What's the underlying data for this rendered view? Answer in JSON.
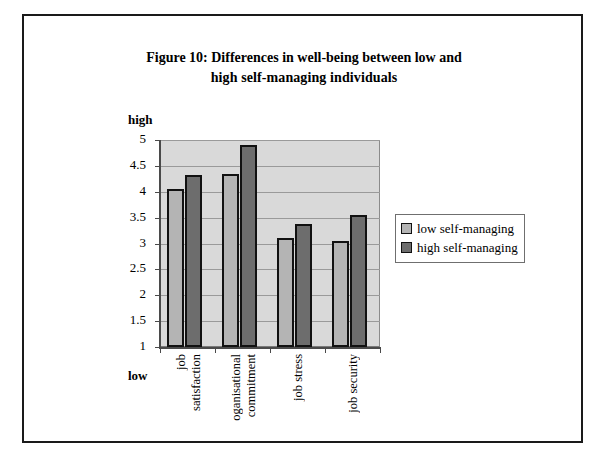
{
  "chart_data": {
    "type": "bar",
    "title_lines": [
      "Figure 10: Differences in well-being between low and",
      "high self-managing individuals"
    ],
    "title": "Figure 10: Differences in well-being between low and high self-managing individuals",
    "categories": [
      "job satisfaction",
      "oganisational commitment",
      "job stress",
      "job security"
    ],
    "category_words": [
      [
        "job",
        "satisfaction"
      ],
      [
        "oganisational",
        "commitment"
      ],
      [
        "job stress"
      ],
      [
        "job security"
      ]
    ],
    "series": [
      {
        "name": "low self-managing",
        "color": "#b4b4b4",
        "values": [
          4.05,
          4.35,
          3.1,
          3.05
        ]
      },
      {
        "name": "high self-managing",
        "color": "#6d6d6d",
        "values": [
          4.32,
          4.9,
          3.37,
          3.55
        ]
      }
    ],
    "ylim": [
      1,
      5
    ],
    "ytick_step": 0.5,
    "ytick_labels": [
      "5",
      "4.5",
      "4",
      "3.5",
      "3",
      "2.5",
      "2",
      "1.5",
      "1"
    ],
    "ytick_values": [
      5,
      4.5,
      4,
      3.5,
      3,
      2.5,
      2,
      1.5,
      1
    ],
    "axis_high_label": "high",
    "axis_low_label": "low",
    "xlabel": "",
    "ylabel": "",
    "grid": true,
    "legend_position": "right",
    "plot_background": "#d9d9d9"
  }
}
